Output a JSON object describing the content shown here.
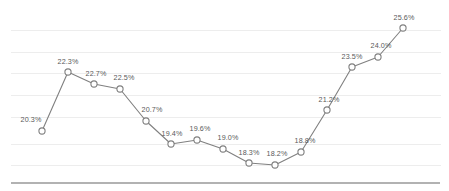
{
  "chart_data": {
    "type": "line",
    "title": "",
    "subtitle": "",
    "xlabel": "",
    "ylabel": "",
    "categories": [
      "1",
      "2",
      "3",
      "4",
      "5",
      "6",
      "7",
      "8",
      "9",
      "10",
      "11",
      "12",
      "13",
      "14",
      "15"
    ],
    "values": [
      20.3,
      22.3,
      22.7,
      22.5,
      20.7,
      19.4,
      19.6,
      19.0,
      18.3,
      18.2,
      18.8,
      21.2,
      23.5,
      24.0,
      25.6
    ],
    "data_labels": [
      "20.3%",
      "22.3%",
      "22.7%",
      "22.5%",
      "20.7%",
      "19.4%",
      "19.6%",
      "19.0%",
      "18.3%",
      "18.2%",
      "18.8%",
      "21.2%",
      "23.5%",
      "24.0%",
      "25.6%"
    ],
    "ylim": [
      17.2,
      26.5
    ],
    "xlim": [
      0,
      16
    ],
    "grid": true,
    "gridlines_y": [
      26.0,
      24.8,
      23.6,
      22.5,
      21.3,
      19.5,
      18.3
    ],
    "legend": null,
    "legend_position": "none",
    "series": [
      {
        "name": "series-1",
        "values": [
          20.3,
          22.3,
          22.7,
          22.5,
          20.7,
          19.4,
          19.6,
          19.0,
          18.3,
          18.2,
          18.8,
          21.2,
          23.5,
          24.0,
          25.6
        ],
        "line_color": "#808080",
        "marker": "circle-open",
        "marker_fill": "#ffffff",
        "marker_stroke": "#808080"
      }
    ],
    "axis_line_color": "#999999",
    "grid_color": "#ededed",
    "label_color": "#595959",
    "background": "#ffffff",
    "tick_labels_x": [],
    "tick_labels_y": []
  },
  "geometry": {
    "points_px": [
      {
        "x": 42,
        "y": 131,
        "label_x": 31,
        "label_y": 124
      },
      {
        "x": 68,
        "y": 72,
        "label_x": 68,
        "label_y": 66
      },
      {
        "x": 94,
        "y": 84,
        "label_x": 96,
        "label_y": 78
      },
      {
        "x": 120,
        "y": 89,
        "label_x": 124,
        "label_y": 82
      },
      {
        "x": 146,
        "y": 121,
        "label_x": 152,
        "label_y": 114
      },
      {
        "x": 171,
        "y": 144,
        "label_x": 172,
        "label_y": 138
      },
      {
        "x": 197,
        "y": 140,
        "label_x": 200,
        "label_y": 133
      },
      {
        "x": 223,
        "y": 149,
        "label_x": 228,
        "label_y": 142
      },
      {
        "x": 249,
        "y": 163,
        "label_x": 249,
        "label_y": 157
      },
      {
        "x": 275,
        "y": 165,
        "label_x": 277,
        "label_y": 158
      },
      {
        "x": 301,
        "y": 152,
        "label_x": 305,
        "label_y": 145
      },
      {
        "x": 327,
        "y": 110,
        "label_x": 329,
        "label_y": 104
      },
      {
        "x": 352,
        "y": 67,
        "label_x": 352,
        "label_y": 61
      },
      {
        "x": 378,
        "y": 57,
        "label_x": 381,
        "label_y": 50
      },
      {
        "x": 403,
        "y": 28,
        "label_x": 404,
        "label_y": 22
      }
    ],
    "gridlines_px": [
      30,
      52,
      73,
      95,
      117,
      144,
      165
    ],
    "axis_baseline_px": {
      "y": 183,
      "x1": 11,
      "x2": 440
    },
    "grid_x1": 11,
    "grid_x2": 441
  }
}
